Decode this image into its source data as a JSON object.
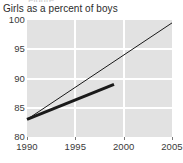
{
  "chart_data": {
    "type": "line",
    "title": "Girls as a percent of boys",
    "subtitle": "",
    "xlabel": "",
    "ylabel": "",
    "xlim": [
      1990,
      2005
    ],
    "ylim": [
      80,
      100
    ],
    "x_ticks": [
      "1990",
      "1995",
      "2000",
      "2005"
    ],
    "x_tick_values": [
      1990,
      1995,
      2000,
      2005
    ],
    "y_ticks": [
      "80",
      "85",
      "90",
      "95",
      "100"
    ],
    "y_tick_values": [
      80,
      85,
      90,
      95,
      100
    ],
    "grid": "white gridlines on gray panel, horizontal at 85/90/95, vertical at 1995/2000",
    "legend": "none",
    "series": [
      {
        "name": "projected-trend",
        "style": "thin",
        "color": "#1a1a1a",
        "width": 1,
        "x": [
          1990,
          2005
        ],
        "values": [
          83.0,
          99.5
        ]
      },
      {
        "name": "actual-trend",
        "style": "thick",
        "color": "#1a1a1a",
        "width": 3,
        "x": [
          1990,
          1999
        ],
        "values": [
          83.0,
          89.0
        ]
      }
    ]
  },
  "panel": {
    "background_color": "#e2e2e2",
    "gridline_color": "#ffffff",
    "text_color": "#3a3a3a",
    "title_color": "#2b2b2b"
  },
  "cropped_header_text": "Figure"
}
